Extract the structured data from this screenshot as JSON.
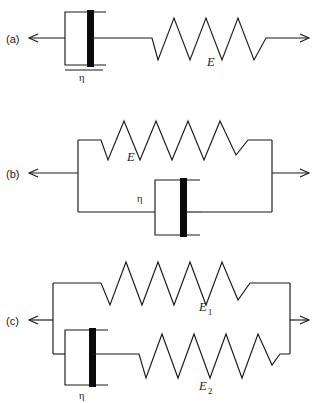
{
  "figure": {
    "name": "viscoelastic-model-diagrams",
    "background_color": "#ffffff",
    "line_color": "#1a1a1a",
    "piston_color": "#0a0a0a",
    "panels": [
      {
        "key": "a",
        "label": "(a)",
        "model": "maxwell",
        "arrangement": "series",
        "elements": [
          {
            "type": "dashpot",
            "label": "η"
          },
          {
            "type": "spring",
            "label": "E",
            "coils": 4
          }
        ],
        "arrows": [
          "left",
          "right"
        ]
      },
      {
        "key": "b",
        "label": "(b)",
        "model": "kelvin-voigt",
        "arrangement": "parallel",
        "elements": [
          {
            "type": "spring",
            "label": "E",
            "coils": 4
          },
          {
            "type": "dashpot",
            "label": "η"
          }
        ],
        "arrows": [
          "left",
          "right"
        ]
      },
      {
        "key": "c",
        "label": "(c)",
        "model": "standard-linear-solid",
        "arrangement": "parallel-with-series-branch",
        "elements": [
          {
            "type": "spring",
            "label": "E",
            "subscript": "1",
            "coils": 4
          },
          {
            "type": "dashpot",
            "label": "η"
          },
          {
            "type": "spring",
            "label": "E",
            "subscript": "2",
            "coils": 4
          }
        ],
        "arrows": [
          "left",
          "right"
        ]
      }
    ]
  },
  "labels": {
    "panel_a": "(a)",
    "panel_b": "(b)",
    "panel_c": "(c)",
    "eta": "η",
    "E": "E",
    "E_base": "E",
    "sub_1": "1",
    "sub_2": "2"
  }
}
